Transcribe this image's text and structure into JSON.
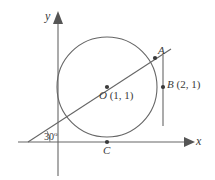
{
  "figure": {
    "background_color": "#ffffff",
    "stroke_color": "#555555",
    "text_color": "#3a3a3a",
    "width": 215,
    "height": 180
  },
  "axes": {
    "x_label": "x",
    "y_label": "y",
    "x_axis": {
      "x1": 18,
      "y1": 142,
      "x2": 188,
      "y2": 142
    },
    "y_axis": {
      "x1": 58,
      "y1": 175,
      "x2": 58,
      "y2": 14
    }
  },
  "circle": {
    "center_x": 107,
    "center_y": 87,
    "radius": 50
  },
  "points": [
    {
      "id": "A",
      "label": "A",
      "px": 155,
      "py": 58
    },
    {
      "id": "O",
      "label": "O",
      "coords": "(1, 1)",
      "full_label": "O (1, 1)",
      "px": 107,
      "py": 87
    },
    {
      "id": "B",
      "label": "B",
      "coords": "(2, 1)",
      "full_label": "B (2, 1)",
      "px": 163,
      "py": 87
    },
    {
      "id": "C",
      "label": "C",
      "px": 107,
      "py": 142
    }
  ],
  "lines": {
    "secant": {
      "x1": 28,
      "y1": 142,
      "x2": 170,
      "y2": 50
    },
    "tangent_vertical": {
      "x1": 163,
      "y1": 56,
      "x2": 163,
      "y2": 125
    }
  },
  "angle": {
    "value": "30",
    "unit": "o",
    "label": "30o",
    "vertex_x": 28,
    "vertex_y": 142
  }
}
